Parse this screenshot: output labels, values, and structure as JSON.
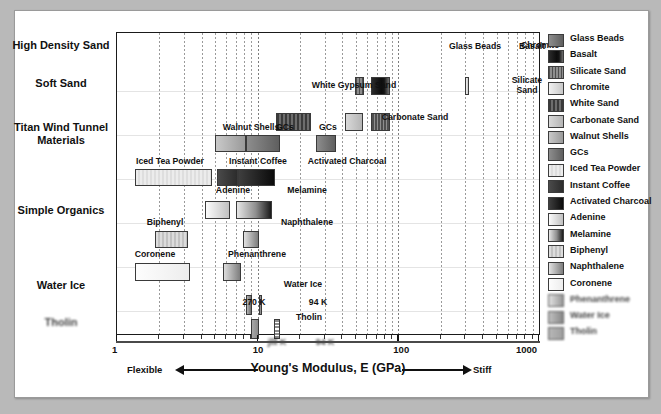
{
  "chart_data": {
    "type": "bar",
    "orientation": "horizontal-ranges",
    "title": "",
    "xlabel": "Young's Modulus, E (GPa)",
    "ylabel": "",
    "xscale": "log",
    "xlim": [
      1,
      1000
    ],
    "xticklabels": [
      "1",
      "10",
      "100",
      "1000"
    ],
    "xtickvalues": [
      1,
      10,
      100,
      1000
    ],
    "grid": "vertical-dotted",
    "legend_position": "right",
    "axis_end_labels": {
      "left": "Flexible",
      "right": "Stiff"
    },
    "categories": [
      "High Density Sand",
      "Soft Sand",
      "Titan Wind Tunnel Materials",
      "Simple Organics",
      "Water Ice",
      "Tholin"
    ],
    "bars": [
      {
        "label": "Glass Beads",
        "category": "High Density Sand",
        "xmin": 49,
        "xmax": 57,
        "row": 0,
        "fill": "silicate"
      },
      {
        "label": "Basalt",
        "category": "High Density Sand",
        "xmin": 64,
        "xmax": 87,
        "row": 0,
        "fill": "basalt"
      },
      {
        "label": "Chromite",
        "category": "High Density Sand",
        "xmin": 300,
        "xmax": 320,
        "row": 0,
        "fill": "chromite"
      },
      {
        "label": "White Gypsum Sand",
        "category": "Soft Sand",
        "xmin": 13.5,
        "xmax": 24,
        "row": 1,
        "fill": "whitesand"
      },
      {
        "label": "Carbonate Sand",
        "category": "Soft Sand",
        "xmin": 42,
        "xmax": 56,
        "row": 1,
        "fill": "carbonate"
      },
      {
        "label": "Silicate Sand",
        "category": "Soft Sand",
        "xmin": 64,
        "xmax": 87,
        "row": 1,
        "fill": "silicate"
      },
      {
        "label": "Walnut Shells",
        "category": "Titan Wind Tunnel Materials",
        "xmin": 5.0,
        "xmax": 8.3,
        "row": 2,
        "fill": "walnut"
      },
      {
        "label": "GCs",
        "category": "Titan Wind Tunnel Materials",
        "xmin": 8.3,
        "xmax": 14.5,
        "row": 2,
        "fill": "gcs"
      },
      {
        "label": "GCs",
        "category": "Titan Wind Tunnel Materials",
        "xmin": 26,
        "xmax": 36,
        "row": 2,
        "fill": "gcs"
      },
      {
        "label": "Iced Tea Powder",
        "category": "Titan Wind Tunnel Materials",
        "xmin": 1.35,
        "xmax": 4.7,
        "row": 3,
        "fill": "icedtea"
      },
      {
        "label": "Instant Coffee",
        "category": "Titan Wind Tunnel Materials",
        "xmin": 5.1,
        "xmax": 7.2,
        "row": 3,
        "fill": "coffee"
      },
      {
        "label": "Activated Charcoal",
        "category": "Titan Wind Tunnel Materials",
        "xmin": 7.2,
        "xmax": 13.3,
        "row": 3,
        "fill": "charcoal"
      },
      {
        "label": "Adenine",
        "category": "Simple Organics",
        "xmin": 4.25,
        "xmax": 6.4,
        "row": 4,
        "fill": "adenine"
      },
      {
        "label": "Melamine",
        "category": "Simple Organics",
        "xmin": 7.0,
        "xmax": 12.6,
        "row": 4,
        "fill": "melamine"
      },
      {
        "label": "Biphenyl",
        "category": "Simple Organics",
        "xmin": 1.85,
        "xmax": 3.2,
        "row": 5,
        "fill": "biphenyl"
      },
      {
        "label": "Naphthalene",
        "category": "Simple Organics",
        "xmin": 7.9,
        "xmax": 10.2,
        "row": 5,
        "fill": "naphthalene"
      },
      {
        "label": "Coronene",
        "category": "Simple Organics",
        "xmin": 1.35,
        "xmax": 3.3,
        "row": 6,
        "fill": "coronene"
      },
      {
        "label": "Phenanthrene",
        "category": "Simple Organics",
        "xmin": 5.7,
        "xmax": 7.6,
        "row": 6,
        "fill": "phenanthrene"
      },
      {
        "label": "270 K",
        "category": "Water Ice",
        "xmin": 8.3,
        "xmax": 9.1,
        "row": 7,
        "fill": "waterice"
      },
      {
        "label": "94 K",
        "category": "Water Ice",
        "xmin": 10.2,
        "xmax": 10.7,
        "row": 7,
        "fill": "waterice"
      },
      {
        "label": "jlll K",
        "category": "Tholin",
        "xmin": 9.0,
        "xmax": 10.2,
        "row": 8,
        "fill": "tholin"
      },
      {
        "label": "94 K",
        "category": "Tholin",
        "xmin": 13.0,
        "xmax": 14.4,
        "row": 8,
        "fill": "tholinb"
      }
    ]
  },
  "axis": {
    "title": "Young's Modulus, E (GPa)",
    "left_end": "Flexible",
    "right_end": "Stiff",
    "ticks": [
      "1",
      "10",
      "100",
      "1000"
    ]
  },
  "categories": [
    {
      "label": "High Density Sand"
    },
    {
      "label": "Soft Sand"
    },
    {
      "label": "Titan Wind Tunnel Materials"
    },
    {
      "label": "Simple Organics"
    },
    {
      "label": "Water Ice"
    },
    {
      "label": "Tholin"
    }
  ],
  "bar_labels": {
    "glass_beads": "Glass Beads",
    "basalt": "Basalt",
    "chromite": "Chromite",
    "white_gypsum_sand": "White Gypsum Sand",
    "carbonate_sand": "Carbonate Sand",
    "silicate_sand": "Silicate Sand",
    "walnut_shells": "Walnut Shells",
    "gcs_a": "GCs",
    "gcs_b": "GCs",
    "iced_tea_powder": "Iced Tea Powder",
    "instant_coffee": "Instant Coffee",
    "activated_charcoal": "Activated Charcoal",
    "adenine": "Adenine",
    "melamine": "Melamine",
    "biphenyl": "Biphenyl",
    "naphthalene": "Naphthalene",
    "coronene": "Coronene",
    "phenanthrene": "Phenanthrene",
    "water_ice": "Water Ice",
    "water_ice_270k": "270 K",
    "water_ice_94k": "94 K",
    "tholin": "Tholin",
    "tholin_270k": "jlll K",
    "tholin_94k": "94 K"
  },
  "legend": {
    "items": [
      {
        "label": "Glass Beads",
        "color": "#6e6e6e"
      },
      {
        "label": "Basalt",
        "color": "#1d1d1d"
      },
      {
        "label": "Silicate Sand",
        "color": "#7a7a7a"
      },
      {
        "label": "Chromite",
        "color": "#d4d4d4"
      },
      {
        "label": "White Sand",
        "color": "#5e5e5e"
      },
      {
        "label": "Carbonate Sand",
        "color": "#c9c9c9"
      },
      {
        "label": "Walnut Shells",
        "color": "#a8a8a8"
      },
      {
        "label": "GCs",
        "color": "#6a6a6a"
      },
      {
        "label": "Iced Tea Powder",
        "color": "#dcdcdc"
      },
      {
        "label": "Instant Coffee",
        "color": "#4a4a4a"
      },
      {
        "label": "Activated Charcoal",
        "color": "#2a2a2a"
      },
      {
        "label": "Adenine",
        "color": "#ececec"
      },
      {
        "label": "Melamine",
        "color": "#9b9b9b"
      },
      {
        "label": "Biphenyl",
        "color": "#c4c4c4"
      },
      {
        "label": "Naphthalene",
        "color": "#909090"
      },
      {
        "label": "Coronene",
        "color": "#f6f6f6"
      },
      {
        "label": "Phenanthrene",
        "color": "#cbcbcb"
      },
      {
        "label": "Water Ice",
        "color": "#8a8a8a"
      },
      {
        "label": "Tholin",
        "color": "#9e9e9e"
      }
    ]
  }
}
